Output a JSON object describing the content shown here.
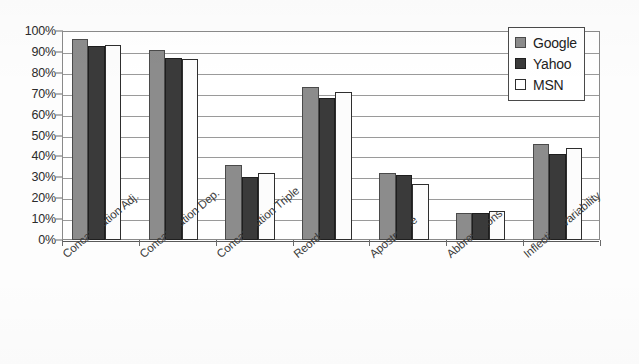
{
  "chart_data": {
    "type": "bar",
    "title": "",
    "xlabel": "",
    "ylabel": "",
    "ylim": [
      0,
      100
    ],
    "grid": true,
    "legend_position": "top-right",
    "categories": [
      "Concatenation Adj.",
      "Concatenation Dep.",
      "Concatenation Triple",
      "Reorder",
      "Apostrophe",
      "Abbreviations",
      "Inflection Variability"
    ],
    "series": [
      {
        "name": "Google",
        "color": "#8c8c8c",
        "values": [
          96,
          91,
          36,
          73,
          32,
          13,
          46
        ]
      },
      {
        "name": "Yahoo",
        "color": "#3a3a3a",
        "values": [
          93,
          87,
          30,
          68,
          31,
          13,
          41
        ]
      },
      {
        "name": "MSN",
        "color": "#ffffff",
        "values": [
          93.5,
          86.5,
          32,
          71,
          27,
          14,
          44
        ]
      }
    ],
    "y_ticks": [
      "0%",
      "10%",
      "20%",
      "30%",
      "40%",
      "50%",
      "60%",
      "70%",
      "80%",
      "90%",
      "100%"
    ],
    "y_tick_values": [
      0,
      10,
      20,
      30,
      40,
      50,
      60,
      70,
      80,
      90,
      100
    ]
  },
  "legend": {
    "items": [
      {
        "label": "Google"
      },
      {
        "label": "Yahoo"
      },
      {
        "label": "MSN"
      }
    ]
  }
}
